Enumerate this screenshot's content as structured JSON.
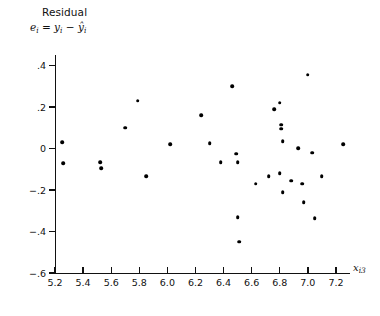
{
  "figure": {
    "title": "Residual",
    "formula_prefix": "e",
    "formula_sub1": "i",
    "formula_eq": " = y",
    "formula_sub2": "i",
    "formula_minus": " − ŷ",
    "formula_sub3": "i",
    "formula_plain": "eᵢ = yᵢ − ŷᵢ"
  },
  "chart_data": {
    "type": "scatter",
    "title": "Residual",
    "xlabel": "xᵢ₃",
    "ylabel": "eᵢ = yᵢ − ŷᵢ",
    "xlim": [
      5.2,
      7.3
    ],
    "ylim": [
      -0.6,
      0.45
    ],
    "xticks": [
      5.2,
      5.4,
      5.6,
      5.8,
      6.0,
      6.2,
      6.4,
      6.6,
      6.8,
      7.0,
      7.2
    ],
    "xtick_labels": [
      "5.2",
      "5.4",
      "5.6",
      "5.8",
      "6.0",
      "6.2",
      "6.4",
      "6.6",
      "6.8",
      "7.0",
      "7.2"
    ],
    "yticks": [
      0.4,
      0.2,
      0.0,
      -0.2,
      -0.4,
      -0.6
    ],
    "ytick_labels": [
      ".4",
      ".2",
      "0",
      "−.2",
      "−.4",
      "−.6"
    ],
    "grid": false,
    "legend": null,
    "marker": "filled-circle",
    "marker_color": "#000000",
    "n_points": 34,
    "points": [
      {
        "x": 5.25,
        "y": 0.03
      },
      {
        "x": 5.26,
        "y": -0.07
      },
      {
        "x": 5.52,
        "y": -0.065
      },
      {
        "x": 5.53,
        "y": -0.095
      },
      {
        "x": 5.7,
        "y": 0.1
      },
      {
        "x": 5.79,
        "y": 0.23
      },
      {
        "x": 5.85,
        "y": -0.135
      },
      {
        "x": 6.02,
        "y": 0.02
      },
      {
        "x": 6.24,
        "y": 0.16
      },
      {
        "x": 6.3,
        "y": 0.025
      },
      {
        "x": 6.38,
        "y": -0.065
      },
      {
        "x": 6.46,
        "y": 0.3
      },
      {
        "x": 6.49,
        "y": -0.025
      },
      {
        "x": 6.5,
        "y": -0.065
      },
      {
        "x": 6.5,
        "y": -0.33
      },
      {
        "x": 6.51,
        "y": -0.45
      },
      {
        "x": 6.63,
        "y": -0.17
      },
      {
        "x": 6.72,
        "y": -0.135
      },
      {
        "x": 6.76,
        "y": 0.19
      },
      {
        "x": 6.8,
        "y": 0.22
      },
      {
        "x": 6.81,
        "y": 0.115
      },
      {
        "x": 6.81,
        "y": 0.095
      },
      {
        "x": 6.82,
        "y": 0.035
      },
      {
        "x": 6.8,
        "y": -0.12
      },
      {
        "x": 6.82,
        "y": -0.21
      },
      {
        "x": 6.88,
        "y": -0.155
      },
      {
        "x": 6.93,
        "y": 0.0
      },
      {
        "x": 6.96,
        "y": -0.17
      },
      {
        "x": 6.97,
        "y": -0.26
      },
      {
        "x": 7.0,
        "y": 0.355
      },
      {
        "x": 7.03,
        "y": -0.02
      },
      {
        "x": 7.05,
        "y": -0.335
      },
      {
        "x": 7.1,
        "y": -0.135
      },
      {
        "x": 7.25,
        "y": 0.02
      }
    ]
  },
  "axes_pixels": {
    "x_left": 55,
    "x_right": 350,
    "y_top": 55,
    "y_bottom": 273,
    "x_min": 5.2,
    "x_max": 7.3,
    "y_min": -0.6,
    "y_max": 0.45
  }
}
